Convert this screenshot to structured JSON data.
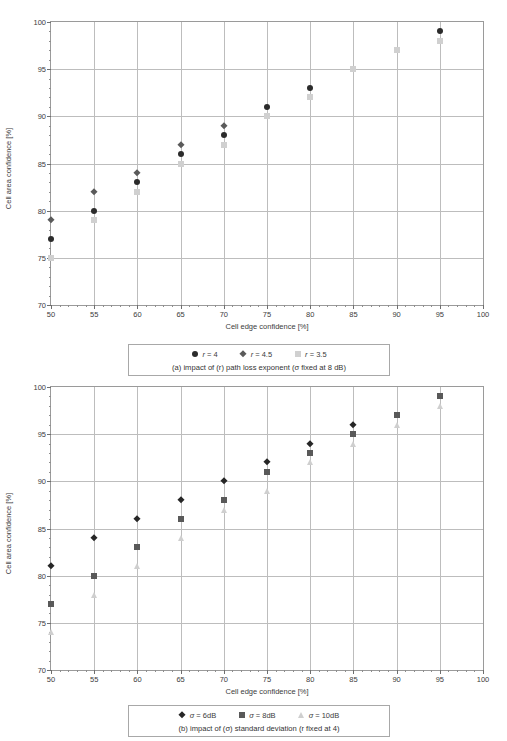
{
  "figures": [
    {
      "id": "fig-a",
      "caption": "(a) impact of (r) path loss exponent (σ fixed at 8 dB)",
      "chart_data": {
        "type": "scatter",
        "title": "",
        "xlabel": "Cell edge confidence [%]",
        "ylabel": "Cell area confidence [%]",
        "xlim": [
          50,
          100
        ],
        "ylim": [
          70,
          100
        ],
        "xticks": [
          50,
          55,
          60,
          65,
          70,
          75,
          80,
          85,
          90,
          95,
          100
        ],
        "yticks": [
          70,
          75,
          80,
          85,
          90,
          95,
          100
        ],
        "grid": true,
        "legend_position": "below",
        "series": [
          {
            "name": "r = 4",
            "marker": "circle",
            "color": "#2b2b2b",
            "x": [
              50,
              55,
              60,
              65,
              70,
              75,
              80,
              95
            ],
            "values": [
              77,
              80,
              83,
              86,
              88,
              91,
              93,
              99
            ]
          },
          {
            "name": "r = 4.5",
            "marker": "diamond",
            "color": "#5a5a5a",
            "x": [
              50,
              55,
              60,
              65,
              70
            ],
            "values": [
              79,
              82,
              84,
              87,
              89
            ]
          },
          {
            "name": "r = 3.5",
            "marker": "square",
            "color": "#d0d0d0",
            "x": [
              50,
              55,
              60,
              65,
              70,
              75,
              80,
              85,
              90,
              95
            ],
            "values": [
              75,
              79,
              82,
              85,
              87,
              90,
              92,
              95,
              97,
              98
            ]
          }
        ]
      }
    },
    {
      "id": "fig-b",
      "caption": "(b) impact of (σ) standard deviation (r fixed at 4)",
      "chart_data": {
        "type": "scatter",
        "title": "",
        "xlabel": "Cell edge confidence [%]",
        "ylabel": "Cell area confidence [%]",
        "xlim": [
          50,
          100
        ],
        "ylim": [
          70,
          100
        ],
        "xticks": [
          50,
          55,
          60,
          65,
          70,
          75,
          80,
          85,
          90,
          95,
          100
        ],
        "yticks": [
          70,
          75,
          80,
          85,
          90,
          95,
          100
        ],
        "grid": true,
        "legend_position": "below",
        "series": [
          {
            "name": "σ = 6dB",
            "marker": "diamond",
            "color": "#262626",
            "x": [
              50,
              55,
              60,
              65,
              70,
              75,
              80,
              85
            ],
            "values": [
              81,
              84,
              86,
              88,
              90,
              92,
              94,
              96
            ]
          },
          {
            "name": "σ = 8dB",
            "marker": "square",
            "color": "#595959",
            "x": [
              50,
              55,
              60,
              65,
              70,
              75,
              80,
              85,
              90,
              95
            ],
            "values": [
              77,
              80,
              83,
              86,
              88,
              91,
              93,
              95,
              97,
              99
            ]
          },
          {
            "name": "σ = 10dB",
            "marker": "triangle",
            "color": "#cfcfcf",
            "x": [
              50,
              55,
              60,
              65,
              70,
              75,
              80,
              85,
              90,
              95
            ],
            "values": [
              74,
              78,
              81,
              84,
              87,
              89,
              92,
              94,
              96,
              98
            ]
          }
        ]
      }
    }
  ]
}
